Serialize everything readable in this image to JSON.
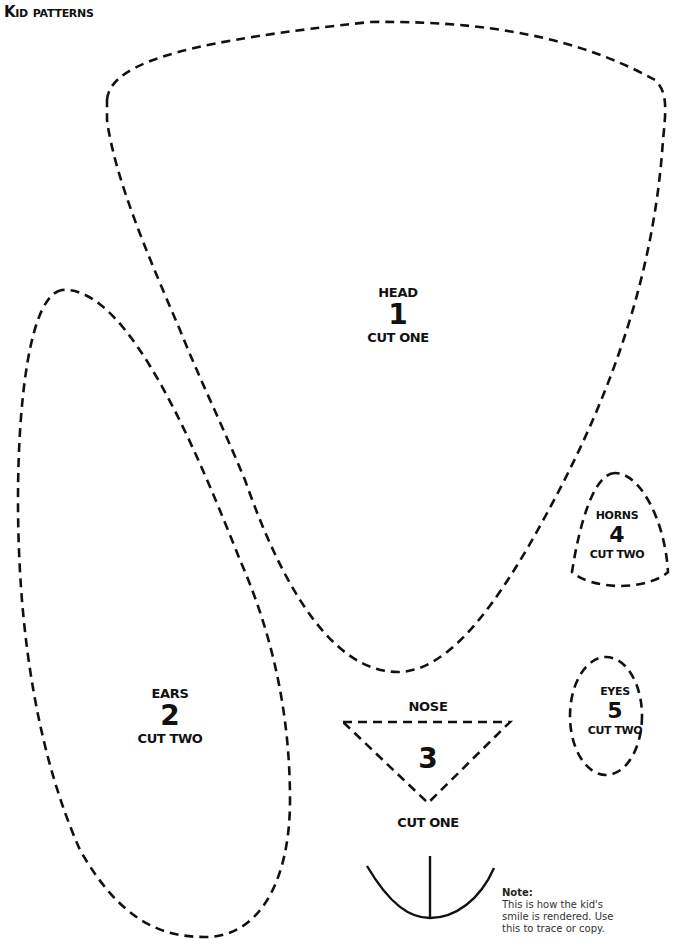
{
  "title": "Kid patterns",
  "pieces": [
    {
      "id": "head",
      "name": "HEAD",
      "number": "1",
      "cut": "CUT ONE"
    },
    {
      "id": "ears",
      "name": "EARS",
      "number": "2",
      "cut": "CUT TWO"
    },
    {
      "id": "nose",
      "name": "NOSE",
      "number": "3",
      "cut": "CUT ONE"
    },
    {
      "id": "horns",
      "name": "HORNS",
      "number": "4",
      "cut": "CUT TWO"
    },
    {
      "id": "eyes",
      "name": "EYES",
      "number": "5",
      "cut": "CUT TWO"
    }
  ],
  "note": {
    "title": "Note:",
    "text": "This is how the kid's smile is rendered.  Use this to trace or copy."
  },
  "colors": {
    "line": "#111111",
    "background": "#ffffff"
  }
}
